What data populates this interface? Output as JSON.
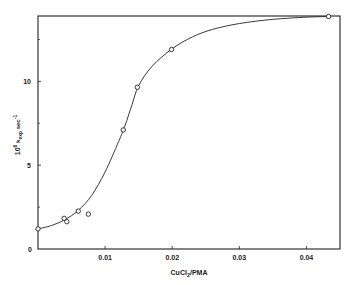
{
  "chart_data": {
    "type": "scatter",
    "title": "",
    "xlabel": "CuCl2/PMA",
    "xlabel_main": "CuCl",
    "xlabel_sub": "2",
    "xlabel_rest": "/PMA",
    "ylabel": "10^6 k_exp sec^-1",
    "ylabel_parts": {
      "pre": "10",
      "sup1": "6",
      "mid": " k",
      "sub": "exp",
      "post": " sec",
      "sup2": "-1"
    },
    "xlim": [
      0,
      0.045
    ],
    "ylim": [
      0,
      13.9
    ],
    "x_ticks": [
      0.01,
      0.02,
      0.03,
      0.04
    ],
    "x_tick_labels": [
      "0.01",
      "0.02",
      "0.03",
      "0.04"
    ],
    "y_ticks": [
      0,
      5,
      10
    ],
    "y_tick_labels": [
      "0",
      "5",
      "10"
    ],
    "y_minor_ticks": [
      2.5,
      7.5,
      12.5
    ],
    "grid": false,
    "legend": null,
    "series": [
      {
        "name": "experimental",
        "marker": "open-circle",
        "points": [
          {
            "x": 0.0,
            "y": 1.2
          },
          {
            "x": 0.0039,
            "y": 1.83
          },
          {
            "x": 0.0043,
            "y": 1.63
          },
          {
            "x": 0.006,
            "y": 2.26
          },
          {
            "x": 0.0075,
            "y": 2.08
          },
          {
            "x": 0.0127,
            "y": 7.1
          },
          {
            "x": 0.0148,
            "y": 9.65
          },
          {
            "x": 0.0199,
            "y": 11.9
          },
          {
            "x": 0.0433,
            "y": 13.87
          }
        ]
      },
      {
        "name": "fitted curve",
        "style": "solid-line",
        "points": [
          {
            "x": 0.0,
            "y": 1.2
          },
          {
            "x": 0.002,
            "y": 1.4
          },
          {
            "x": 0.004,
            "y": 1.75
          },
          {
            "x": 0.006,
            "y": 2.3
          },
          {
            "x": 0.008,
            "y": 3.2
          },
          {
            "x": 0.01,
            "y": 4.6
          },
          {
            "x": 0.012,
            "y": 6.4
          },
          {
            "x": 0.013,
            "y": 7.4
          },
          {
            "x": 0.014,
            "y": 8.6
          },
          {
            "x": 0.015,
            "y": 9.75
          },
          {
            "x": 0.017,
            "y": 10.9
          },
          {
            "x": 0.02,
            "y": 11.95
          },
          {
            "x": 0.023,
            "y": 12.65
          },
          {
            "x": 0.026,
            "y": 13.1
          },
          {
            "x": 0.03,
            "y": 13.45
          },
          {
            "x": 0.035,
            "y": 13.7
          },
          {
            "x": 0.04,
            "y": 13.83
          },
          {
            "x": 0.0433,
            "y": 13.87
          }
        ]
      }
    ]
  },
  "colors": {
    "ink": "#222222",
    "background": "#ffffff"
  }
}
